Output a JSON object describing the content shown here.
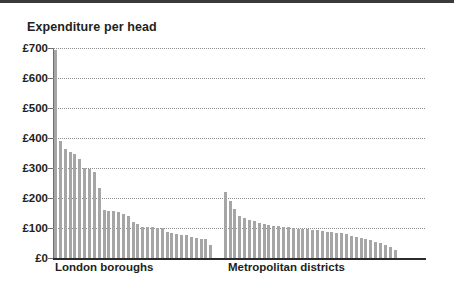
{
  "chart_title": "Expenditure per head",
  "axis": {
    "y_ticks": [
      "£0",
      "£100",
      "£200",
      "£300",
      "£400",
      "£500",
      "£600",
      "£700"
    ],
    "y_tick_values": [
      0,
      100,
      200,
      300,
      400,
      500,
      600,
      700
    ],
    "ylim": [
      0,
      700
    ]
  },
  "groups": {
    "london_label": "London boroughs",
    "metro_label": "Metropolitan districts"
  },
  "style": {
    "bar_color": "#a6a6a6",
    "axis_color": "#2b2b2b",
    "grid_color": "#8d8d8d",
    "text_color": "#231f20",
    "background": "#ffffff",
    "top_border": "#3a3a3a"
  },
  "chart_data": {
    "type": "bar",
    "title": "Expenditure per head",
    "xlabel": "",
    "ylabel": "Expenditure per head (£)",
    "ylim": [
      0,
      700
    ],
    "yticks": [
      0,
      100,
      200,
      300,
      400,
      500,
      600,
      700
    ],
    "ytick_labels": [
      "£0",
      "£100",
      "£200",
      "£300",
      "£400",
      "£500",
      "£600",
      "£700"
    ],
    "grid": "horizontal-dotted",
    "legend": "none",
    "unit": "GBP per head",
    "groups": [
      {
        "name": "London boroughs",
        "categories": [
          "LB1",
          "LB2",
          "LB3",
          "LB4",
          "LB5",
          "LB6",
          "LB7",
          "LB8",
          "LB9",
          "LB10",
          "LB11",
          "LB12",
          "LB13",
          "LB14",
          "LB15",
          "LB16",
          "LB17",
          "LB18",
          "LB19",
          "LB20",
          "LB21",
          "LB22",
          "LB23",
          "LB24",
          "LB25",
          "LB26",
          "LB27",
          "LB28",
          "LB29",
          "LB30",
          "LB31",
          "LB32",
          "LB33"
        ],
        "values": [
          695,
          390,
          362,
          352,
          348,
          330,
          300,
          298,
          288,
          235,
          160,
          158,
          157,
          155,
          148,
          140,
          120,
          112,
          105,
          103,
          102,
          100,
          100,
          88,
          84,
          80,
          78,
          76,
          70,
          66,
          64,
          62,
          45
        ]
      },
      {
        "name": "Metropolitan districts",
        "categories": [
          "MD1",
          "MD2",
          "MD3",
          "MD4",
          "MD5",
          "MD6",
          "MD7",
          "MD8",
          "MD9",
          "MD10",
          "MD11",
          "MD12",
          "MD13",
          "MD14",
          "MD15",
          "MD16",
          "MD17",
          "MD18",
          "MD19",
          "MD20",
          "MD21",
          "MD22",
          "MD23",
          "MD24",
          "MD25",
          "MD26",
          "MD27",
          "MD28",
          "MD29",
          "MD30",
          "MD31",
          "MD32",
          "MD33",
          "MD34",
          "MD35",
          "MD36"
        ],
        "values": [
          220,
          190,
          165,
          140,
          132,
          126,
          122,
          118,
          112,
          110,
          108,
          106,
          104,
          102,
          100,
          98,
          97,
          96,
          94,
          92,
          90,
          88,
          86,
          84,
          82,
          80,
          72,
          70,
          68,
          64,
          60,
          55,
          50,
          44,
          38,
          26
        ]
      }
    ],
    "gap_between_groups_bars": 2
  }
}
